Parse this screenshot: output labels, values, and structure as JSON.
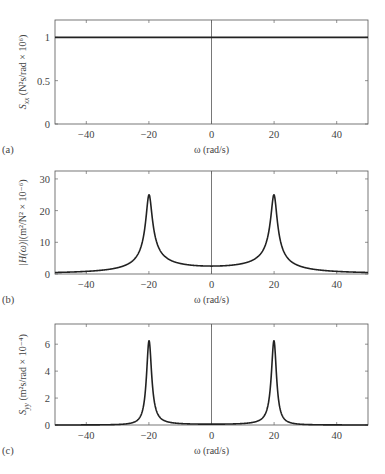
{
  "chart_data": [
    {
      "type": "line",
      "panel_label": "(a)",
      "title": "",
      "xlabel": "ω (rad/s)",
      "ylabel": "Sxx (N²s/rad × 10⁶)",
      "ylabel_main": "S",
      "ylabel_sub": "xx",
      "ylabel_rest": " (N²s/rad × 10⁶)",
      "xlim": [
        -50,
        50
      ],
      "ylim": [
        0,
        1.2
      ],
      "xticks": [
        -40,
        -20,
        0,
        20,
        40
      ],
      "yticks": [
        0,
        0.5,
        1
      ],
      "ytick_labels": [
        "0",
        "0.5",
        "1"
      ],
      "grid": false,
      "series": [
        {
          "name": "Sxx",
          "x": [
            -50,
            50
          ],
          "values": [
            1,
            1
          ]
        }
      ],
      "vline_x": 0
    },
    {
      "type": "line",
      "panel_label": "(b)",
      "title": "",
      "xlabel": "ω (rad/s)",
      "ylabel": "|H(ω)|(m²/N² × 10⁻⁶)",
      "ylabel_main": "|H(ω)|",
      "ylabel_sub": "",
      "ylabel_rest": "(m²/N² × 10⁻⁶)",
      "xlim": [
        -50,
        50
      ],
      "ylim": [
        0,
        32.5
      ],
      "xticks": [
        -40,
        -20,
        0,
        20,
        40
      ],
      "yticks": [
        0,
        10,
        20,
        30
      ],
      "ytick_labels": [
        "0",
        "10",
        "20",
        "30"
      ],
      "grid": false,
      "series": [
        {
          "name": "|H(ω)|",
          "peak_x": [
            -20,
            20
          ],
          "peak_value": 25,
          "center_value": 2.5,
          "edge_value": 0.6
        }
      ],
      "vline_x": 0
    },
    {
      "type": "line",
      "panel_label": "(c)",
      "title": "",
      "xlabel": "ω (rad/s)",
      "ylabel": "Syy (m²s/rad × 10⁻⁴)",
      "ylabel_main": "S",
      "ylabel_sub": "yy",
      "ylabel_rest": " (m²s/rad × 10⁻⁴)",
      "xlim": [
        -50,
        50
      ],
      "ylim": [
        0,
        7.5
      ],
      "xticks": [
        -40,
        -20,
        0,
        20,
        40
      ],
      "yticks": [
        0,
        2,
        4,
        6
      ],
      "ytick_labels": [
        "0",
        "2",
        "4",
        "6"
      ],
      "grid": false,
      "series": [
        {
          "name": "Syy",
          "peak_x": [
            -20,
            20
          ],
          "peak_value": 6.25,
          "center_value": 0.06,
          "edge_value": 0.0
        }
      ],
      "vline_x": 0
    }
  ],
  "layout": {
    "x_left": 55,
    "x_right": 368,
    "panels": [
      {
        "top": 20,
        "bottom": 124
      },
      {
        "top": 171,
        "bottom": 274
      },
      {
        "top": 324,
        "bottom": 425
      }
    ]
  }
}
